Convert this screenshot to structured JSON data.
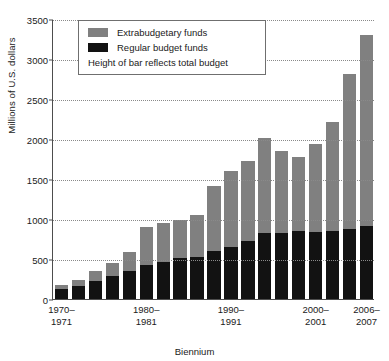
{
  "chart_data": {
    "type": "bar",
    "stacked": true,
    "title": "",
    "xlabel": "Biennium",
    "ylabel": "Millions of U.S. dollars",
    "ylim": [
      0,
      3500
    ],
    "yticks": [
      0,
      500,
      1000,
      1500,
      2000,
      2500,
      3000,
      3500
    ],
    "ytick_labels": [
      "0",
      "500",
      "1000",
      "1500",
      "2000",
      "2500",
      "3000",
      "3500"
    ],
    "grid": "horizontal-dotted",
    "legend_position": "top-left-inside",
    "categories": [
      "1970-1971",
      "1972-1973",
      "1974-1975",
      "1976-1977",
      "1978-1979",
      "1980-1981",
      "1982-1983",
      "1984-1985",
      "1986-1987",
      "1988-1989",
      "1990-1991",
      "1992-1993",
      "1994-1995",
      "1996-1997",
      "1998-1999",
      "2000-2001",
      "2002-2003",
      "2004-2005",
      "2006-2007"
    ],
    "xtick_labels": [
      {
        "index": 0,
        "line1": "1970–",
        "line2": "1971"
      },
      {
        "index": 5,
        "line1": "1980–",
        "line2": "1981"
      },
      {
        "index": 10,
        "line1": "1990–",
        "line2": "1991"
      },
      {
        "index": 15,
        "line1": "2000–",
        "line2": "2001"
      },
      {
        "index": 18,
        "line1": "2006–",
        "line2": "2007"
      }
    ],
    "series": [
      {
        "name": "Regular budget funds",
        "color": "#121212",
        "values": [
          120,
          165,
          220,
          285,
          350,
          425,
          465,
          510,
          525,
          600,
          645,
          730,
          820,
          820,
          850,
          840,
          845,
          880,
          915
        ]
      },
      {
        "name": "Extrabudgetary funds",
        "color": "#808080",
        "values": [
          55,
          75,
          130,
          165,
          240,
          475,
          490,
          480,
          530,
          810,
          950,
          990,
          1190,
          1030,
          920,
          1095,
          1370,
          1930,
          2385
        ]
      }
    ],
    "totals": [
      175,
      240,
      350,
      450,
      590,
      900,
      955,
      990,
      1055,
      1410,
      1595,
      1720,
      2010,
      1850,
      1770,
      1935,
      2215,
      2810,
      3300
    ]
  },
  "legend": {
    "entries": [
      {
        "label": "Extrabudgetary funds",
        "color": "#808080"
      },
      {
        "label": "Regular budget funds",
        "color": "#121212"
      }
    ],
    "note": "Height of bar reflects total budget"
  }
}
